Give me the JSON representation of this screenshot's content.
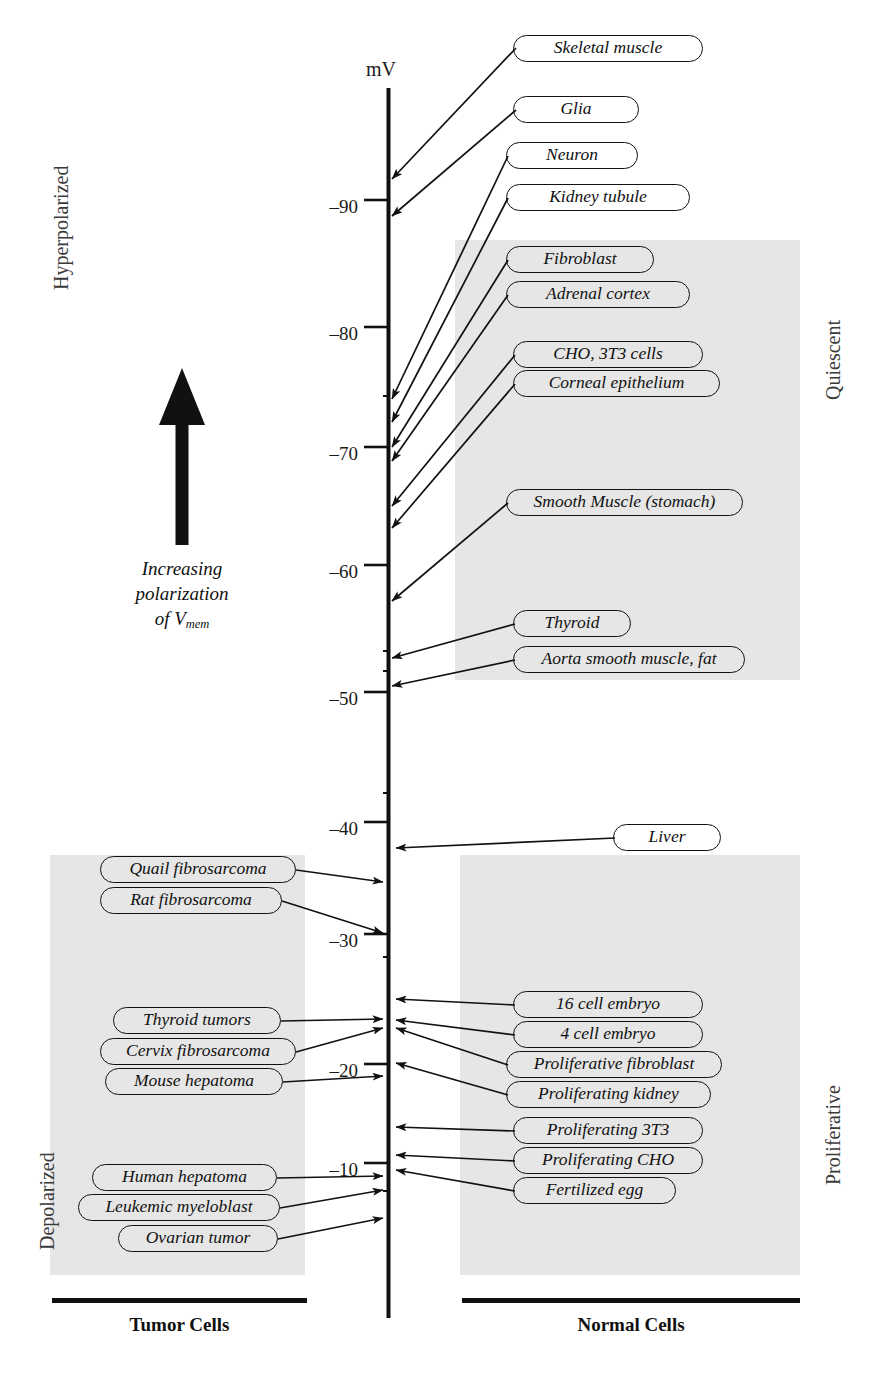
{
  "chart_data": {
    "type": "scatter",
    "axis_unit_label": "mV",
    "ylabel": "mV",
    "xlabel": "",
    "ylim": [
      -95,
      -3
    ],
    "grid": false,
    "tick_labels": [
      "–90",
      "–80",
      "–70",
      "–60",
      "–50",
      "–40",
      "–30",
      "–20",
      "–10"
    ],
    "tick_values": [
      -90,
      -80,
      -70,
      -60,
      -50,
      -40,
      -30,
      -20,
      -10
    ],
    "series": [
      {
        "name": "Normal Cells",
        "side": "right",
        "points": [
          {
            "label": "Skeletal muscle",
            "value": -92
          },
          {
            "label": "Glia",
            "value": -90
          },
          {
            "label": "Neuron",
            "value": -75
          },
          {
            "label": "Kidney tubule",
            "value": -72
          },
          {
            "label": "Fibroblast",
            "value": -70
          },
          {
            "label": "Adrenal cortex",
            "value": -69
          },
          {
            "label": "CHO, 3T3 cells",
            "value": -65
          },
          {
            "label": "Corneal epithelium",
            "value": -64
          },
          {
            "label": "Smooth Muscle (stomach)",
            "value": -57
          },
          {
            "label": "Thyroid",
            "value": -52
          },
          {
            "label": "Aorta smooth muscle, fat",
            "value": -50
          },
          {
            "label": "Liver",
            "value": -39
          },
          {
            "label": "16 cell embryo",
            "value": -25
          },
          {
            "label": "4 cell embryo",
            "value": -23
          },
          {
            "label": "Proliferative fibroblast",
            "value": -22
          },
          {
            "label": "Proliferating kidney",
            "value": -19
          },
          {
            "label": "Proliferating 3T3",
            "value": -14
          },
          {
            "label": "Proliferating CHO",
            "value": -11
          },
          {
            "label": "Fertilized egg",
            "value": -10
          }
        ]
      },
      {
        "name": "Tumor Cells",
        "side": "left",
        "points": [
          {
            "label": "Quail fibrosarcoma",
            "value": -37
          },
          {
            "label": "Rat fibrosarcoma",
            "value": -31
          },
          {
            "label": "Thyroid tumors",
            "value": -24
          },
          {
            "label": "Cervix fibrosarcoma",
            "value": -22
          },
          {
            "label": "Mouse hepatoma",
            "value": -20
          },
          {
            "label": "Human hepatoma",
            "value": -10
          },
          {
            "label": "Leukemic myeloblast",
            "value": -8
          },
          {
            "label": "Ovarian tumor",
            "value": -5
          }
        ]
      }
    ],
    "annotations": [
      {
        "text": "Increasing polarization of Vmem",
        "position": "left-center"
      },
      {
        "text": "Hyperpolarized",
        "position": "far-left-top"
      },
      {
        "text": "Depolarized",
        "position": "far-left-bottom"
      },
      {
        "text": "Quiescent",
        "position": "far-right-top"
      },
      {
        "text": "Proliferative",
        "position": "far-right-bottom"
      }
    ],
    "legend_position": "bottom"
  },
  "axis": {
    "unit": "mV",
    "ticks": [
      {
        "text": "–90",
        "top": 196
      },
      {
        "text": "–80",
        "top": 323
      },
      {
        "text": "–70",
        "top": 443
      },
      {
        "text": "–60",
        "top": 561
      },
      {
        "text": "–50",
        "top": 688
      },
      {
        "text": "–40",
        "top": 818
      },
      {
        "text": "–30",
        "top": 930
      },
      {
        "text": "–20",
        "top": 1060
      },
      {
        "text": "–10",
        "top": 1159
      }
    ]
  },
  "side_labels": {
    "hyperpolarized": "Hyperpolarized",
    "depolarized": "Depolarized",
    "quiescent": "Quiescent",
    "proliferative": "Proliferative"
  },
  "annotation": {
    "line1": "Increasing",
    "line2": "polarization",
    "line3_prefix": "of V",
    "line3_sub": "mem"
  },
  "groups": {
    "tumor": "Tumor Cells",
    "normal": "Normal Cells"
  },
  "normal_cells": [
    {
      "label": "Skeletal muscle",
      "box_left": 513,
      "box_top": 35,
      "box_width": 190,
      "tip_x": 392,
      "tip_y": 179,
      "anchor_x": 516,
      "anchor_y": 48
    },
    {
      "label": "Glia",
      "box_left": 513,
      "box_top": 96,
      "box_width": 126,
      "tip_x": 392,
      "tip_y": 216,
      "anchor_x": 516,
      "anchor_y": 110
    },
    {
      "label": "Neuron",
      "box_left": 506,
      "box_top": 142,
      "box_width": 132,
      "tip_x": 392,
      "tip_y": 399,
      "anchor_x": 508,
      "anchor_y": 156
    },
    {
      "label": "Kidney tubule",
      "box_left": 506,
      "box_top": 184,
      "box_width": 184,
      "tip_x": 392,
      "tip_y": 422,
      "anchor_x": 508,
      "anchor_y": 198
    },
    {
      "label": "Fibroblast",
      "box_left": 506,
      "box_top": 246,
      "box_width": 148,
      "tip_x": 392,
      "tip_y": 447,
      "anchor_x": 508,
      "anchor_y": 260
    },
    {
      "label": "Adrenal cortex",
      "box_left": 506,
      "box_top": 281,
      "box_width": 184,
      "tip_x": 392,
      "tip_y": 461,
      "anchor_x": 508,
      "anchor_y": 295
    },
    {
      "label": "CHO, 3T3 cells",
      "box_left": 513,
      "box_top": 341,
      "box_width": 190,
      "tip_x": 392,
      "tip_y": 506,
      "anchor_x": 515,
      "anchor_y": 355
    },
    {
      "label": "Corneal epithelium",
      "box_left": 513,
      "box_top": 370,
      "box_width": 207,
      "tip_x": 392,
      "tip_y": 528,
      "anchor_x": 515,
      "anchor_y": 384
    },
    {
      "label": "Smooth Muscle (stomach)",
      "box_left": 506,
      "box_top": 489,
      "box_width": 237,
      "tip_x": 392,
      "tip_y": 601,
      "anchor_x": 508,
      "anchor_y": 503
    },
    {
      "label": "Thyroid",
      "box_left": 513,
      "box_top": 610,
      "box_width": 118,
      "tip_x": 392,
      "tip_y": 658,
      "anchor_x": 515,
      "anchor_y": 624
    },
    {
      "label": "Aorta smooth muscle, fat",
      "box_left": 513,
      "box_top": 646,
      "box_width": 232,
      "tip_x": 392,
      "tip_y": 686,
      "anchor_x": 515,
      "anchor_y": 660
    },
    {
      "label": "Liver",
      "box_left": 613,
      "box_top": 824,
      "box_width": 108,
      "tip_x": 396,
      "tip_y": 848,
      "anchor_x": 615,
      "anchor_y": 838
    },
    {
      "label": "16 cell embryo",
      "box_left": 513,
      "box_top": 991,
      "box_width": 190,
      "tip_x": 396,
      "tip_y": 999,
      "anchor_x": 515,
      "anchor_y": 1005
    },
    {
      "label": "4 cell embryo",
      "box_left": 513,
      "box_top": 1021,
      "box_width": 190,
      "tip_x": 396,
      "tip_y": 1020,
      "anchor_x": 515,
      "anchor_y": 1035
    },
    {
      "label": "Proliferative fibroblast",
      "box_left": 506,
      "box_top": 1051,
      "box_width": 216,
      "tip_x": 396,
      "tip_y": 1028,
      "anchor_x": 508,
      "anchor_y": 1065
    },
    {
      "label": "Proliferating kidney",
      "box_left": 506,
      "box_top": 1081,
      "box_width": 205,
      "tip_x": 396,
      "tip_y": 1063,
      "anchor_x": 508,
      "anchor_y": 1095
    },
    {
      "label": "Proliferating 3T3",
      "box_left": 513,
      "box_top": 1117,
      "box_width": 190,
      "tip_x": 396,
      "tip_y": 1127,
      "anchor_x": 515,
      "anchor_y": 1131
    },
    {
      "label": "Proliferating CHO",
      "box_left": 513,
      "box_top": 1147,
      "box_width": 190,
      "tip_x": 396,
      "tip_y": 1155,
      "anchor_x": 515,
      "anchor_y": 1161
    },
    {
      "label": "Fertilized egg",
      "box_left": 513,
      "box_top": 1177,
      "box_width": 163,
      "tip_x": 396,
      "tip_y": 1170,
      "anchor_x": 515,
      "anchor_y": 1191
    }
  ],
  "tumor_cells": [
    {
      "label": "Quail fibrosarcoma",
      "box_left": 100,
      "box_top": 856,
      "box_width": 196,
      "tip_x": 383,
      "tip_y": 882,
      "anchor_x": 296,
      "anchor_y": 870
    },
    {
      "label": "Rat fibrosarcoma",
      "box_left": 100,
      "box_top": 887,
      "box_width": 182,
      "tip_x": 383,
      "tip_y": 933,
      "anchor_x": 282,
      "anchor_y": 901
    },
    {
      "label": "Thyroid tumors",
      "box_left": 113,
      "box_top": 1007,
      "box_width": 168,
      "tip_x": 383,
      "tip_y": 1019,
      "anchor_x": 281,
      "anchor_y": 1021
    },
    {
      "label": "Cervix fibrosarcoma",
      "box_left": 100,
      "box_top": 1038,
      "box_width": 196,
      "tip_x": 383,
      "tip_y": 1028,
      "anchor_x": 296,
      "anchor_y": 1052
    },
    {
      "label": "Mouse hepatoma",
      "box_left": 105,
      "box_top": 1068,
      "box_width": 178,
      "tip_x": 383,
      "tip_y": 1076,
      "anchor_x": 283,
      "anchor_y": 1082
    },
    {
      "label": "Human hepatoma",
      "box_left": 92,
      "box_top": 1164,
      "box_width": 185,
      "tip_x": 383,
      "tip_y": 1176,
      "anchor_x": 277,
      "anchor_y": 1178
    },
    {
      "label": "Leukemic myeloblast",
      "box_left": 78,
      "box_top": 1194,
      "box_width": 202,
      "tip_x": 383,
      "tip_y": 1190,
      "anchor_x": 280,
      "anchor_y": 1208
    },
    {
      "label": "Ovarian tumor",
      "box_left": 118,
      "box_top": 1225,
      "box_width": 160,
      "tip_x": 383,
      "tip_y": 1218,
      "anchor_x": 278,
      "anchor_y": 1239
    }
  ]
}
